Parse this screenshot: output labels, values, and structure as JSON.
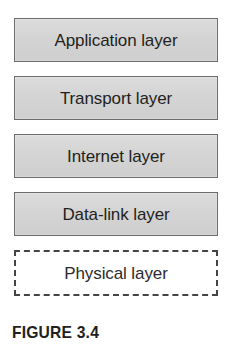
{
  "figure": {
    "caption": "FIGURE 3.4",
    "background_color": "#ffffff",
    "box_fill_color": "#d6d6d6",
    "box_border_color": "#6d6d6d",
    "dashed_border_color": "#444444",
    "text_color": "#231f20"
  },
  "stack": {
    "layers": [
      {
        "label": "Application layer",
        "style": "solid"
      },
      {
        "label": "Transport layer",
        "style": "solid"
      },
      {
        "label": "Internet layer",
        "style": "solid"
      },
      {
        "label": "Data-link layer",
        "style": "solid"
      },
      {
        "label": "Physical layer",
        "style": "dashed"
      }
    ]
  }
}
